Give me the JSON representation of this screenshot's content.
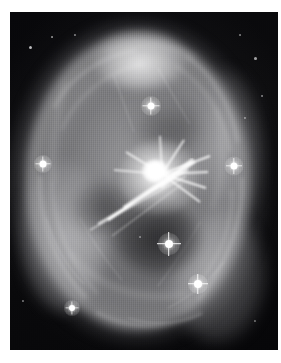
{
  "image": {
    "kind": "astronomical-photograph",
    "subject": "bipolar planetary nebula with bright central core and radiating jets",
    "rendering": "grayscale / monochrome negative-free positive print",
    "alt_text": "Grayscale astronomical image of an elliptical nebula shell surrounding a bright central knot with linear jet filaments, several foreground stars with four-point diffraction spikes, on a dark sky background.",
    "plate": {
      "left": 10,
      "top": 12,
      "width": 268,
      "height": 338,
      "background_color": "#050506",
      "paper_color": "#ffffff"
    },
    "palette": {
      "paper": "#ffffff",
      "sky": "#050506",
      "nebula_mid": "#a8a8ac",
      "nebula_bright": "#e8e8ea",
      "core": "#ffffff",
      "cavity": "#0a0a0c"
    },
    "features": [
      {
        "name": "outer-halo",
        "shape": "ellipse",
        "cx": 0.47,
        "cy": 0.5,
        "rx": 0.47,
        "ry": 0.47,
        "brightness": "low"
      },
      {
        "name": "bright-shell-ring",
        "shape": "ellipse-annulus",
        "cx": 0.5,
        "cy": 0.5,
        "rx": 0.42,
        "ry": 0.44,
        "brightness": "high"
      },
      {
        "name": "top-bright-cap",
        "shape": "blob",
        "cx": 0.49,
        "cy": 0.14,
        "brightness": "very-high"
      },
      {
        "name": "lower-left-limb",
        "shape": "arc",
        "cx": 0.2,
        "cy": 0.66,
        "brightness": "high"
      },
      {
        "name": "lower-right-limb",
        "shape": "arc",
        "cx": 0.77,
        "cy": 0.78,
        "brightness": "high"
      },
      {
        "name": "dark-cavity",
        "shape": "ellipse",
        "cx": 0.55,
        "cy": 0.66,
        "brightness": "very-low"
      },
      {
        "name": "central-core",
        "shape": "point-source-with-spikes",
        "cx": 0.54,
        "cy": 0.47,
        "brightness": "saturated"
      },
      {
        "name": "jet-filaments",
        "shape": "linear-streaks",
        "direction": "core toward lower-left",
        "count": 4
      }
    ],
    "stars": [
      {
        "name": "star-upper-center",
        "x": 150,
        "y": 105,
        "size": 9,
        "spikes": true,
        "mag": "bright"
      },
      {
        "name": "star-left-limb",
        "x": 42,
        "y": 163,
        "size": 9,
        "spikes": true,
        "mag": "bright"
      },
      {
        "name": "star-right-limb",
        "x": 233,
        "y": 165,
        "size": 9,
        "spikes": true,
        "mag": "bright"
      },
      {
        "name": "star-lower-center",
        "x": 168,
        "y": 243,
        "size": 11,
        "spikes": true,
        "mag": "very-bright"
      },
      {
        "name": "star-lower-right",
        "x": 197,
        "y": 283,
        "size": 10,
        "spikes": true,
        "mag": "bright"
      },
      {
        "name": "star-lower-left",
        "x": 71,
        "y": 307,
        "size": 8,
        "spikes": true,
        "mag": "moderate"
      },
      {
        "name": "star-field-a",
        "x": 30,
        "y": 47,
        "size": 3,
        "spikes": false,
        "mag": "faint"
      },
      {
        "name": "star-field-b",
        "x": 52,
        "y": 37,
        "size": 2,
        "spikes": false,
        "mag": "faint"
      },
      {
        "name": "star-field-c",
        "x": 75,
        "y": 35,
        "size": 2,
        "spikes": false,
        "mag": "faint"
      },
      {
        "name": "star-field-d",
        "x": 240,
        "y": 35,
        "size": 2,
        "spikes": false,
        "mag": "faint"
      },
      {
        "name": "star-field-e",
        "x": 255,
        "y": 58,
        "size": 3,
        "spikes": false,
        "mag": "faint"
      },
      {
        "name": "star-field-f",
        "x": 262,
        "y": 96,
        "size": 2,
        "spikes": false,
        "mag": "faint"
      },
      {
        "name": "star-field-g",
        "x": 245,
        "y": 118,
        "size": 2,
        "spikes": false,
        "mag": "faint"
      },
      {
        "name": "star-field-h",
        "x": 22,
        "y": 300,
        "size": 2,
        "spikes": false,
        "mag": "faint"
      },
      {
        "name": "star-field-i",
        "x": 255,
        "y": 320,
        "size": 2,
        "spikes": false,
        "mag": "faint"
      },
      {
        "name": "star-field-j",
        "x": 140,
        "y": 236,
        "size": 2,
        "spikes": false,
        "mag": "faint"
      }
    ]
  }
}
